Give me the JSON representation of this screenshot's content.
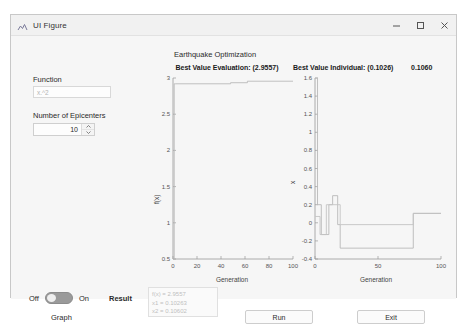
{
  "window": {
    "title": "UI Figure",
    "icon": "matlab-figure-icon",
    "controls": {
      "minimize": "minimize-icon",
      "maximize": "maximize-icon",
      "close": "close-icon"
    }
  },
  "section": {
    "title": "Earthquake Optimization"
  },
  "controls": {
    "function_label": "Function",
    "function_value": "x.^2",
    "function_placeholder": "x.^2",
    "epicenters_label": "Number of Epicenters",
    "epicenters_value": "10",
    "graph_label": "Graph",
    "toggle_off": "Off",
    "toggle_on": "On",
    "result_label": "Result",
    "result_lines": [
      "f(x) = 2.9557",
      "x1 = 0.10263",
      "x2 = 0.10602"
    ],
    "run_button": "Run",
    "exit_button": "Exit"
  },
  "chart_data": [
    {
      "type": "line",
      "id": "best-value-evaluation",
      "title": "Best Value Evaluation: (2.9557)",
      "xlabel": "Generation",
      "ylabel": "f(x)",
      "xlim": [
        0,
        100
      ],
      "ylim": [
        0.5,
        3
      ],
      "xticks": [
        "0",
        "20",
        "40",
        "60",
        "80",
        "100"
      ],
      "xtick_values": [
        0,
        20,
        40,
        60,
        80,
        100
      ],
      "yticks": [
        "0.5",
        "1",
        "1.5",
        "2",
        "2.5",
        "3"
      ],
      "ytick_values": [
        0.5,
        1,
        1.5,
        2,
        2.5,
        3
      ],
      "grid": false,
      "legend": "none",
      "series": [
        {
          "name": "Best Value",
          "line_color": "#b9b9b9",
          "step": true,
          "x": [
            0,
            1,
            1,
            2,
            2,
            48,
            48,
            62,
            62,
            100
          ],
          "y": [
            0.5,
            0.5,
            2.92,
            2.92,
            2.92,
            2.92,
            2.935,
            2.935,
            2.9557,
            2.9557
          ]
        }
      ]
    },
    {
      "type": "line",
      "id": "best-value-individual",
      "title": "Best Value Individual: (0.1026)",
      "title_extra": "0.1060",
      "xlabel": "Generation",
      "ylabel": "x",
      "xlim": [
        0,
        100
      ],
      "ylim": [
        -0.4,
        1.6
      ],
      "xticks": [
        "0",
        "50",
        "100"
      ],
      "xtick_values": [
        0,
        50,
        100
      ],
      "yticks": [
        "-0.4",
        "-0.2",
        "0",
        "0.2",
        "0.4",
        "0.6",
        "0.8",
        "1",
        "1.2",
        "1.4",
        "1.6"
      ],
      "ytick_values": [
        -0.4,
        -0.2,
        0,
        0.2,
        0.4,
        0.6,
        0.8,
        1,
        1.2,
        1.4,
        1.6
      ],
      "grid": false,
      "legend": "none",
      "series": [
        {
          "name": "x1",
          "line_color": "#b9b9b9",
          "step": true,
          "x": [
            0,
            2,
            2,
            5,
            5,
            11,
            11,
            14,
            14,
            18,
            18,
            20,
            20,
            78,
            78,
            100
          ],
          "y": [
            1.6,
            1.6,
            0.2,
            0.2,
            -0.13,
            -0.13,
            0.2,
            0.2,
            0.3,
            0.3,
            -0.02,
            -0.02,
            -0.28,
            -0.28,
            0.1026,
            0.1026
          ]
        },
        {
          "name": "x2",
          "line_color": "#c4c4c4",
          "step": true,
          "x": [
            0,
            4,
            4,
            9,
            9,
            20,
            20,
            78,
            78,
            100
          ],
          "y": [
            0.07,
            0.07,
            -0.13,
            -0.13,
            0.2,
            0.2,
            -0.02,
            -0.02,
            0.106,
            0.106
          ]
        }
      ]
    }
  ]
}
